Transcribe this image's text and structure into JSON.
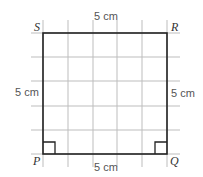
{
  "diagram": {
    "shape": "square",
    "vertices": {
      "top_left": "S",
      "top_right": "R",
      "bottom_left": "P",
      "bottom_right": "Q"
    },
    "side_labels": {
      "top": "5 cm",
      "bottom": "5 cm",
      "left": "5 cm",
      "right": "5 cm"
    },
    "grid": {
      "cells": 5
    },
    "right_angle_markers": [
      "P",
      "Q"
    ],
    "colors": {
      "outline": "#222222",
      "grid": "#bbbbbb",
      "text": "#555555"
    }
  }
}
